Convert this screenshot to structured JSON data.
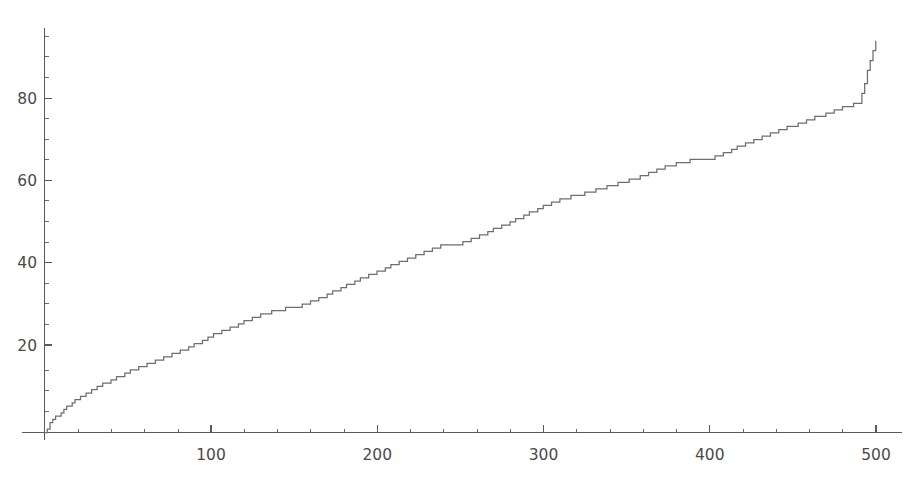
{
  "chart_data": {
    "type": "line",
    "title": "",
    "subtitle": "",
    "xlabel": "",
    "ylabel": "",
    "xlim": [
      0,
      507
    ],
    "ylim": [
      0,
      97
    ],
    "grid": false,
    "legend": null,
    "series_style": "step",
    "line_color": "#6e6e6e",
    "background_color": "#ffffff",
    "axis_color": "#5a5a5a",
    "x_ticks_major": [
      100,
      200,
      300,
      400,
      500
    ],
    "x_ticks_major_labels": [
      "100",
      "200",
      "300",
      "400",
      "500"
    ],
    "x_ticks_minor_step": 20,
    "y_ticks_major": [
      20,
      40,
      60,
      80
    ],
    "y_ticks_major_labels": [
      "20",
      "40",
      "60",
      "80"
    ],
    "y_ticks_minor_step": 5,
    "series": [
      {
        "name": "cumulative-step-curve",
        "x": [
          0,
          2,
          4,
          6,
          8,
          10,
          12,
          14,
          16,
          18,
          20,
          25,
          30,
          35,
          40,
          45,
          50,
          55,
          60,
          65,
          70,
          75,
          80,
          85,
          90,
          95,
          100,
          110,
          120,
          130,
          140,
          150,
          160,
          170,
          180,
          190,
          200,
          210,
          220,
          230,
          240,
          250,
          260,
          270,
          280,
          290,
          300,
          310,
          320,
          330,
          340,
          350,
          360,
          370,
          380,
          390,
          400,
          410,
          420,
          430,
          440,
          450,
          460,
          470,
          480,
          490,
          500
        ],
        "y": [
          0,
          1.2,
          2.4,
          3.3,
          4.2,
          5.0,
          5.7,
          6.4,
          7.0,
          7.6,
          8.2,
          9.4,
          10.5,
          11.6,
          12.6,
          13.6,
          14.5,
          15.4,
          16.3,
          17.1,
          17.9,
          18.7,
          19.5,
          20.3,
          21.2,
          22.2,
          23.3,
          25.1,
          26.8,
          28.4,
          29.8,
          30.2,
          31.6,
          33.5,
          35.4,
          37.2,
          39.0,
          40.7,
          42.3,
          44.0,
          45.6,
          45.8,
          47.4,
          49.2,
          51.0,
          53.0,
          54.8,
          56.4,
          57.6,
          58.6,
          59.8,
          61.0,
          62.4,
          63.9,
          65.4,
          66.2,
          66.5,
          68.1,
          69.8,
          71.4,
          73.0,
          74.5,
          76.0,
          77.4,
          78.8,
          80.1,
          81.0
        ],
        "final_x": 500,
        "final_y": 95.2
      }
    ]
  },
  "axes": {
    "origin_label": "",
    "x_axis_name": "x-axis",
    "y_axis_name": "y-axis"
  }
}
